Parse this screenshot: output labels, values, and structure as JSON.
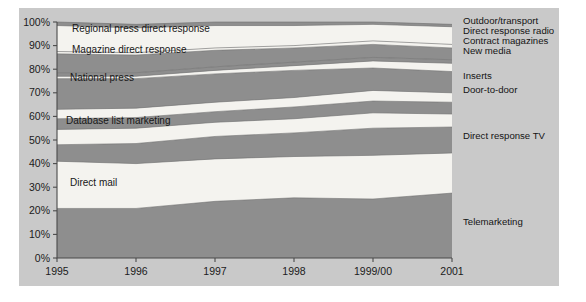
{
  "figure": {
    "panel_bg": "#c9c9c9",
    "page_bg": "#ffffff",
    "band_dark": "#8e8e8e",
    "band_light": "#f4f3ef",
    "axis_color": "#4a4a4a"
  },
  "chart_data": {
    "type": "area",
    "title": "",
    "subtitle": "",
    "xlabel": "",
    "ylabel": "",
    "stacked": true,
    "normalized_percent": true,
    "grid": false,
    "legend_position": "right",
    "ylim": [
      0,
      100
    ],
    "ytick_labels": [
      "0%",
      "10%",
      "20%",
      "30%",
      "40%",
      "50%",
      "60%",
      "70%",
      "80%",
      "90%",
      "100%"
    ],
    "ytick_values": [
      0,
      10,
      20,
      30,
      40,
      50,
      60,
      70,
      80,
      90,
      100
    ],
    "categories": [
      "1995",
      "1996",
      "1997",
      "1998",
      "1999/00",
      "2001"
    ],
    "x": [
      "1995",
      "1996",
      "1997",
      "1998",
      "1999/00",
      "2001"
    ],
    "series": [
      {
        "name": "Telemarketing",
        "fill": "dark",
        "label_side": "right",
        "values": [
          21.0,
          21.0,
          24.0,
          25.5,
          25.0,
          27.5
        ]
      },
      {
        "name": "Direct mail",
        "fill": "light",
        "label_side": "inside",
        "values": [
          20.0,
          19.0,
          18.0,
          17.5,
          18.5,
          17.0
        ]
      },
      {
        "name": "Direct response TV",
        "fill": "dark",
        "label_side": "right",
        "values": [
          7.0,
          8.5,
          9.5,
          10.0,
          11.5,
          11.0
        ]
      },
      {
        "name": "Database list marketing",
        "fill": "light",
        "label_side": "inside",
        "values": [
          6.5,
          6.5,
          6.0,
          6.0,
          6.5,
          5.5
        ]
      },
      {
        "name": "Door-to-door",
        "fill": "dark",
        "label_side": "right",
        "values": [
          4.5,
          4.5,
          4.5,
          5.0,
          5.0,
          5.0
        ]
      },
      {
        "name": "Inserts",
        "fill": "light",
        "label_side": "right",
        "values": [
          4.0,
          4.0,
          4.0,
          4.0,
          4.5,
          4.0
        ]
      },
      {
        "name": "National press",
        "fill": "dark",
        "label_side": "inside",
        "values": [
          13.0,
          12.5,
          12.0,
          11.5,
          9.5,
          9.0
        ]
      },
      {
        "name": "New media",
        "fill": "light",
        "label_side": "right",
        "values": [
          1.0,
          1.0,
          1.5,
          2.0,
          3.0,
          3.5
        ]
      },
      {
        "name": "Contract magazines",
        "fill": "dark",
        "label_side": "right",
        "values": [
          1.5,
          1.5,
          1.5,
          1.5,
          1.5,
          1.5
        ]
      },
      {
        "name": "Magazine direct response",
        "fill": "dark",
        "label_side": "inside",
        "values": [
          8.0,
          7.5,
          7.0,
          6.0,
          5.5,
          5.0
        ]
      },
      {
        "name": "Direct response radio",
        "fill": "light",
        "label_side": "right",
        "values": [
          1.0,
          1.0,
          1.0,
          1.0,
          1.5,
          1.5
        ]
      },
      {
        "name": "Regional press direct response",
        "fill": "light",
        "label_side": "inside",
        "values": [
          11.0,
          10.5,
          9.5,
          8.5,
          7.0,
          7.5
        ]
      },
      {
        "name": "Outdoor/transport",
        "fill": "dark",
        "label_side": "right",
        "values": [
          1.5,
          1.5,
          1.5,
          1.5,
          1.0,
          1.0
        ]
      }
    ],
    "inside_labels": [
      {
        "text": "Regional press direct response",
        "x": 72,
        "y": 32
      },
      {
        "text": "Magazine direct response",
        "x": 72,
        "y": 53
      },
      {
        "text": "National press",
        "x": 70,
        "y": 81
      },
      {
        "text": "Database list marketing",
        "x": 66,
        "y": 124
      },
      {
        "text": "Direct mail",
        "x": 70,
        "y": 186
      }
    ],
    "legend_entries": [
      {
        "label": "Outdoor/transport",
        "y": 24
      },
      {
        "label": "Direct response radio",
        "y": 34
      },
      {
        "label": "Contract magazines",
        "y": 44
      },
      {
        "label": "New media",
        "y": 54
      },
      {
        "label": "Inserts",
        "y": 79
      },
      {
        "label": "Door-to-door",
        "y": 93
      },
      {
        "label": "Direct response TV",
        "y": 139
      },
      {
        "label": "Telemarketing",
        "y": 225
      }
    ],
    "xtick_labels": [
      "1995",
      "1996",
      "1997",
      "1998",
      "1999/00",
      "2001"
    ]
  }
}
